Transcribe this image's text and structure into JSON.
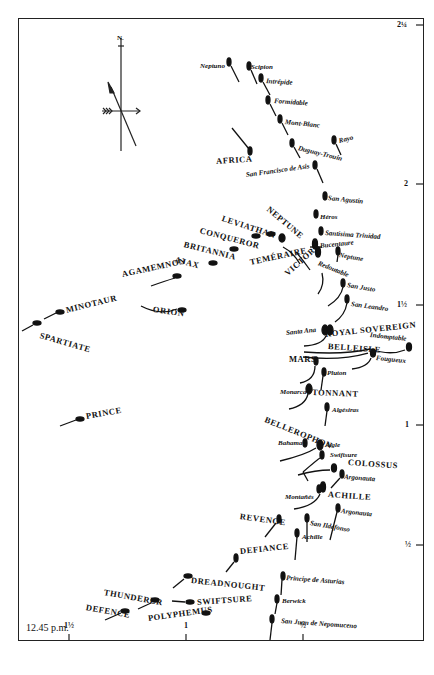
{
  "map": {
    "title_time": "12.45 p.m.",
    "compass": {
      "north_label": "N."
    },
    "right_axis_ticks": [
      {
        "label": "2¼",
        "y": 25
      },
      {
        "label": "2",
        "y": 184
      },
      {
        "label": "1½",
        "y": 305
      },
      {
        "label": "1",
        "y": 425
      },
      {
        "label": "½",
        "y": 545
      }
    ],
    "bottom_axis_ticks": [
      {
        "label": "1½",
        "x": 69
      },
      {
        "label": "1",
        "x": 186
      },
      {
        "label": "½",
        "x": 303
      }
    ],
    "british_ships": [
      {
        "name": "NEPTUNE",
        "x": 268,
        "y": 204,
        "rot": 40
      },
      {
        "name": "LEVIATHAN",
        "x": 222,
        "y": 214,
        "rot": 18
      },
      {
        "name": "CONQUEROR",
        "x": 200,
        "y": 226,
        "rot": 15
      },
      {
        "name": "BRITANNIA",
        "x": 184,
        "y": 240,
        "rot": 14
      },
      {
        "name": "AJAX",
        "x": 175,
        "y": 255,
        "rot": 15
      },
      {
        "name": "AGAMEMNON",
        "x": 122,
        "y": 270,
        "rot": -12
      },
      {
        "name": "TEMÉRAIRE",
        "x": 250,
        "y": 258,
        "rot": -12
      },
      {
        "name": "VICTORY",
        "x": 286,
        "y": 270,
        "rot": -42
      },
      {
        "name": "ORION",
        "x": 153,
        "y": 305,
        "rot": 8
      },
      {
        "name": "MINOTAUR",
        "x": 66,
        "y": 306,
        "rot": -14
      },
      {
        "name": "SPARTIATE",
        "x": 40,
        "y": 331,
        "rot": 16
      },
      {
        "name": "PRINCE",
        "x": 86,
        "y": 412,
        "rot": -10
      },
      {
        "name": "ROYAL SOVEREIGN",
        "x": 325,
        "y": 330,
        "rot": -6
      },
      {
        "name": "BELLEISLE",
        "x": 328,
        "y": 342,
        "rot": 4
      },
      {
        "name": "MARS",
        "x": 289,
        "y": 355,
        "rot": 0
      },
      {
        "name": "TONNANT",
        "x": 312,
        "y": 388,
        "rot": 2
      },
      {
        "name": "BELLEROPHON",
        "x": 265,
        "y": 415,
        "rot": 22
      },
      {
        "name": "COLOSSUS",
        "x": 348,
        "y": 458,
        "rot": 4
      },
      {
        "name": "ACHILLE",
        "x": 328,
        "y": 490,
        "rot": 4
      },
      {
        "name": "REVENGE",
        "x": 240,
        "y": 512,
        "rot": 8
      },
      {
        "name": "DEFIANCE",
        "x": 240,
        "y": 547,
        "rot": -6
      },
      {
        "name": "DREADNOUGHT",
        "x": 191,
        "y": 576,
        "rot": 6
      },
      {
        "name": "SWIFTSURE",
        "x": 197,
        "y": 598,
        "rot": -4
      },
      {
        "name": "THUNDERER",
        "x": 104,
        "y": 588,
        "rot": 10
      },
      {
        "name": "DEFENCE",
        "x": 86,
        "y": 603,
        "rot": 10
      },
      {
        "name": "POLYPHEMUS",
        "x": 148,
        "y": 614,
        "rot": -8
      },
      {
        "name": "AFRICA",
        "x": 216,
        "y": 157,
        "rot": -4
      }
    ],
    "enemy_ships": [
      {
        "name": "Neptuno",
        "x": 200,
        "y": 63,
        "rot": 0
      },
      {
        "name": "Scipion",
        "x": 251,
        "y": 64,
        "rot": 0
      },
      {
        "name": "Intrépide",
        "x": 266,
        "y": 78,
        "rot": 4
      },
      {
        "name": "Formidable",
        "x": 274,
        "y": 98,
        "rot": 4
      },
      {
        "name": "Mont-Blanc",
        "x": 285,
        "y": 119,
        "rot": 6
      },
      {
        "name": "Rayo",
        "x": 339,
        "y": 138,
        "rot": -14
      },
      {
        "name": "Duguay-Trouin",
        "x": 298,
        "y": 145,
        "rot": 14
      },
      {
        "name": "San Francisco de Asis",
        "x": 246,
        "y": 172,
        "rot": -8
      },
      {
        "name": "San Agustin",
        "x": 328,
        "y": 195,
        "rot": 6
      },
      {
        "name": "Héros",
        "x": 320,
        "y": 214,
        "rot": 0
      },
      {
        "name": "Santisima Trinidad",
        "x": 325,
        "y": 230,
        "rot": 4
      },
      {
        "name": "Bucentaure",
        "x": 320,
        "y": 243,
        "rot": -6
      },
      {
        "name": "Neptune",
        "x": 339,
        "y": 252,
        "rot": 10
      },
      {
        "name": "Redoutable",
        "x": 318,
        "y": 260,
        "rot": 22
      },
      {
        "name": "San Justo",
        "x": 347,
        "y": 282,
        "rot": 10
      },
      {
        "name": "San Leandro",
        "x": 351,
        "y": 301,
        "rot": 8
      },
      {
        "name": "Santa Ana",
        "x": 286,
        "y": 330,
        "rot": -6
      },
      {
        "name": "Indomptable",
        "x": 370,
        "y": 332,
        "rot": 6
      },
      {
        "name": "Fougueux",
        "x": 376,
        "y": 355,
        "rot": 6
      },
      {
        "name": "Pluton",
        "x": 327,
        "y": 370,
        "rot": 0
      },
      {
        "name": "Monarca",
        "x": 280,
        "y": 389,
        "rot": 0
      },
      {
        "name": "Algésiras",
        "x": 332,
        "y": 407,
        "rot": 0
      },
      {
        "name": "Bahama",
        "x": 278,
        "y": 440,
        "rot": 0
      },
      {
        "name": "Aigle",
        "x": 325,
        "y": 442,
        "rot": 0
      },
      {
        "name": "Swiftsure",
        "x": 330,
        "y": 452,
        "rot": 0
      },
      {
        "name": "Argonauta",
        "x": 344,
        "y": 474,
        "rot": 4
      },
      {
        "name": "Montañés",
        "x": 285,
        "y": 494,
        "rot": 0
      },
      {
        "name": "Argonauta",
        "x": 341,
        "y": 508,
        "rot": 6
      },
      {
        "name": "San Ildefonso",
        "x": 310,
        "y": 520,
        "rot": 10
      },
      {
        "name": "Achille",
        "x": 302,
        "y": 534,
        "rot": 0
      },
      {
        "name": "Principe de Asturias",
        "x": 286,
        "y": 575,
        "rot": 4
      },
      {
        "name": "Berwick",
        "x": 282,
        "y": 598,
        "rot": 0
      },
      {
        "name": "San Juan de Nepomuceno",
        "x": 281,
        "y": 618,
        "rot": 4
      }
    ]
  }
}
